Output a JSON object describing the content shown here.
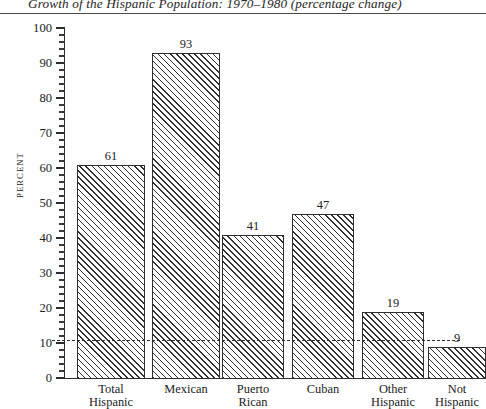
{
  "figure": {
    "title": "Growth of the Hispanic Population: 1970–1980 (percentage change)",
    "y_axis_title": "PERCENT"
  },
  "chart_data": {
    "type": "bar",
    "title": "Growth of the Hispanic Population: 1970–1980 (percentage change)",
    "xlabel": "",
    "ylabel": "PERCENT",
    "ylim": [
      0,
      100
    ],
    "ytick_labels": [
      "0",
      "10",
      "20",
      "30",
      "40",
      "50",
      "60",
      "70",
      "80",
      "90",
      "100"
    ],
    "ytick_values": [
      0,
      10,
      20,
      30,
      40,
      50,
      60,
      70,
      80,
      90,
      100
    ],
    "minor_tick_interval": 2,
    "grid": false,
    "legend": "none",
    "categories": [
      "Total Hispanic",
      "Mexican",
      "Puerto Rican",
      "Cuban",
      "Other Hispanic",
      "Not Hispanic"
    ],
    "category_lines": [
      [
        "Total",
        "Hispanic"
      ],
      [
        "Mexican",
        ""
      ],
      [
        "Puerto",
        "Rican"
      ],
      [
        "Cuban",
        ""
      ],
      [
        "Other",
        "Hispanic"
      ],
      [
        "Not",
        "Hispanic"
      ]
    ],
    "values": [
      61,
      93,
      41,
      47,
      19,
      9
    ],
    "value_labels": [
      "61",
      "93",
      "41",
      "47",
      "19",
      "9"
    ],
    "bar_fill": "diagonal-hatch",
    "bar_edge_color": "#2f2f2f",
    "reference_line": {
      "value": 11,
      "style": "dashed",
      "color": "#2f2f2f"
    }
  }
}
